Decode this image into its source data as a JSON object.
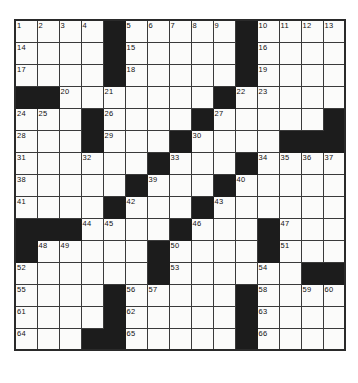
{
  "puzzle": {
    "title": "Crossword Puzzle Grid",
    "rows": 15,
    "cols": 15,
    "cell_size_px": 22,
    "colors": {
      "block": "#1c1c1c",
      "open": "#fbfbfa",
      "grid_line": "#3a3a3a",
      "border": "#2a2a2a",
      "number_text": "#111111"
    },
    "numbers_visible": [
      1,
      2,
      3,
      4,
      5,
      6,
      7,
      8,
      9,
      10,
      11,
      12,
      13,
      14,
      15,
      16,
      17,
      18,
      19,
      20,
      21,
      22,
      23,
      24,
      25,
      26,
      27,
      28,
      29,
      30,
      31,
      32,
      33,
      34,
      35,
      36,
      37,
      38,
      39,
      40,
      41,
      42,
      43,
      44,
      45,
      46,
      47,
      48,
      49,
      50,
      51,
      52,
      53,
      54,
      55,
      56,
      57,
      58,
      59,
      60,
      61,
      62,
      63,
      64,
      65,
      66
    ],
    "grid": [
      [
        {
          "block": false,
          "num": "1"
        },
        {
          "block": false,
          "num": "2"
        },
        {
          "block": false,
          "num": "3"
        },
        {
          "block": false,
          "num": "4"
        },
        {
          "block": true,
          "num": ""
        },
        {
          "block": false,
          "num": "5"
        },
        {
          "block": false,
          "num": "6"
        },
        {
          "block": false,
          "num": "7"
        },
        {
          "block": false,
          "num": "8"
        },
        {
          "block": false,
          "num": "9"
        },
        {
          "block": true,
          "num": ""
        },
        {
          "block": false,
          "num": "10"
        },
        {
          "block": false,
          "num": "11"
        },
        {
          "block": false,
          "num": "12"
        },
        {
          "block": false,
          "num": "13"
        }
      ],
      [
        {
          "block": false,
          "num": "14"
        },
        {
          "block": false,
          "num": ""
        },
        {
          "block": false,
          "num": ""
        },
        {
          "block": false,
          "num": ""
        },
        {
          "block": true,
          "num": ""
        },
        {
          "block": false,
          "num": "15"
        },
        {
          "block": false,
          "num": ""
        },
        {
          "block": false,
          "num": ""
        },
        {
          "block": false,
          "num": ""
        },
        {
          "block": false,
          "num": ""
        },
        {
          "block": true,
          "num": ""
        },
        {
          "block": false,
          "num": "16"
        },
        {
          "block": false,
          "num": ""
        },
        {
          "block": false,
          "num": ""
        },
        {
          "block": false,
          "num": ""
        }
      ],
      [
        {
          "block": false,
          "num": "17"
        },
        {
          "block": false,
          "num": ""
        },
        {
          "block": false,
          "num": ""
        },
        {
          "block": false,
          "num": ""
        },
        {
          "block": true,
          "num": ""
        },
        {
          "block": false,
          "num": "18"
        },
        {
          "block": false,
          "num": ""
        },
        {
          "block": false,
          "num": ""
        },
        {
          "block": false,
          "num": ""
        },
        {
          "block": false,
          "num": ""
        },
        {
          "block": true,
          "num": ""
        },
        {
          "block": false,
          "num": "19"
        },
        {
          "block": false,
          "num": ""
        },
        {
          "block": false,
          "num": ""
        },
        {
          "block": false,
          "num": ""
        }
      ],
      [
        {
          "block": true,
          "num": ""
        },
        {
          "block": true,
          "num": ""
        },
        {
          "block": false,
          "num": "20"
        },
        {
          "block": false,
          "num": ""
        },
        {
          "block": false,
          "num": "21"
        },
        {
          "block": false,
          "num": ""
        },
        {
          "block": false,
          "num": ""
        },
        {
          "block": false,
          "num": ""
        },
        {
          "block": false,
          "num": ""
        },
        {
          "block": true,
          "num": ""
        },
        {
          "block": false,
          "num": "22"
        },
        {
          "block": false,
          "num": "23"
        },
        {
          "block": false,
          "num": ""
        },
        {
          "block": false,
          "num": ""
        },
        {
          "block": false,
          "num": ""
        }
      ],
      [
        {
          "block": false,
          "num": "24"
        },
        {
          "block": false,
          "num": "25"
        },
        {
          "block": false,
          "num": ""
        },
        {
          "block": true,
          "num": ""
        },
        {
          "block": false,
          "num": "26"
        },
        {
          "block": false,
          "num": ""
        },
        {
          "block": false,
          "num": ""
        },
        {
          "block": false,
          "num": ""
        },
        {
          "block": true,
          "num": ""
        },
        {
          "block": false,
          "num": "27"
        },
        {
          "block": false,
          "num": ""
        },
        {
          "block": false,
          "num": ""
        },
        {
          "block": false,
          "num": ""
        },
        {
          "block": false,
          "num": ""
        },
        {
          "block": true,
          "num": ""
        }
      ],
      [
        {
          "block": false,
          "num": "28"
        },
        {
          "block": false,
          "num": ""
        },
        {
          "block": false,
          "num": ""
        },
        {
          "block": true,
          "num": ""
        },
        {
          "block": false,
          "num": "29"
        },
        {
          "block": false,
          "num": ""
        },
        {
          "block": false,
          "num": ""
        },
        {
          "block": true,
          "num": ""
        },
        {
          "block": false,
          "num": "30"
        },
        {
          "block": false,
          "num": ""
        },
        {
          "block": false,
          "num": ""
        },
        {
          "block": false,
          "num": ""
        },
        {
          "block": true,
          "num": ""
        },
        {
          "block": true,
          "num": ""
        },
        {
          "block": true,
          "num": ""
        }
      ],
      [
        {
          "block": false,
          "num": "31"
        },
        {
          "block": false,
          "num": ""
        },
        {
          "block": false,
          "num": ""
        },
        {
          "block": false,
          "num": "32"
        },
        {
          "block": false,
          "num": ""
        },
        {
          "block": false,
          "num": ""
        },
        {
          "block": true,
          "num": ""
        },
        {
          "block": false,
          "num": "33"
        },
        {
          "block": false,
          "num": ""
        },
        {
          "block": false,
          "num": ""
        },
        {
          "block": true,
          "num": ""
        },
        {
          "block": false,
          "num": "34"
        },
        {
          "block": false,
          "num": "35"
        },
        {
          "block": false,
          "num": "36"
        },
        {
          "block": false,
          "num": "37"
        }
      ],
      [
        {
          "block": false,
          "num": "38"
        },
        {
          "block": false,
          "num": ""
        },
        {
          "block": false,
          "num": ""
        },
        {
          "block": false,
          "num": ""
        },
        {
          "block": false,
          "num": ""
        },
        {
          "block": true,
          "num": ""
        },
        {
          "block": false,
          "num": "39"
        },
        {
          "block": false,
          "num": ""
        },
        {
          "block": false,
          "num": ""
        },
        {
          "block": true,
          "num": ""
        },
        {
          "block": false,
          "num": "40"
        },
        {
          "block": false,
          "num": ""
        },
        {
          "block": false,
          "num": ""
        },
        {
          "block": false,
          "num": ""
        },
        {
          "block": false,
          "num": ""
        }
      ],
      [
        {
          "block": false,
          "num": "41"
        },
        {
          "block": false,
          "num": ""
        },
        {
          "block": false,
          "num": ""
        },
        {
          "block": false,
          "num": ""
        },
        {
          "block": true,
          "num": ""
        },
        {
          "block": false,
          "num": "42"
        },
        {
          "block": false,
          "num": ""
        },
        {
          "block": false,
          "num": ""
        },
        {
          "block": true,
          "num": ""
        },
        {
          "block": false,
          "num": "43"
        },
        {
          "block": false,
          "num": ""
        },
        {
          "block": false,
          "num": ""
        },
        {
          "block": false,
          "num": ""
        },
        {
          "block": false,
          "num": ""
        },
        {
          "block": false,
          "num": ""
        }
      ],
      [
        {
          "block": true,
          "num": ""
        },
        {
          "block": true,
          "num": ""
        },
        {
          "block": true,
          "num": ""
        },
        {
          "block": false,
          "num": "44"
        },
        {
          "block": false,
          "num": "45"
        },
        {
          "block": false,
          "num": ""
        },
        {
          "block": false,
          "num": ""
        },
        {
          "block": true,
          "num": ""
        },
        {
          "block": false,
          "num": "46"
        },
        {
          "block": false,
          "num": ""
        },
        {
          "block": false,
          "num": ""
        },
        {
          "block": true,
          "num": ""
        },
        {
          "block": false,
          "num": "47"
        },
        {
          "block": false,
          "num": ""
        },
        {
          "block": false,
          "num": ""
        }
      ],
      [
        {
          "block": true,
          "num": ""
        },
        {
          "block": false,
          "num": "48"
        },
        {
          "block": false,
          "num": "49"
        },
        {
          "block": false,
          "num": ""
        },
        {
          "block": false,
          "num": ""
        },
        {
          "block": false,
          "num": ""
        },
        {
          "block": true,
          "num": ""
        },
        {
          "block": false,
          "num": "50"
        },
        {
          "block": false,
          "num": ""
        },
        {
          "block": false,
          "num": ""
        },
        {
          "block": false,
          "num": ""
        },
        {
          "block": true,
          "num": ""
        },
        {
          "block": false,
          "num": "51"
        },
        {
          "block": false,
          "num": ""
        },
        {
          "block": false,
          "num": ""
        }
      ],
      [
        {
          "block": false,
          "num": "52"
        },
        {
          "block": false,
          "num": ""
        },
        {
          "block": false,
          "num": ""
        },
        {
          "block": false,
          "num": ""
        },
        {
          "block": false,
          "num": ""
        },
        {
          "block": false,
          "num": ""
        },
        {
          "block": true,
          "num": ""
        },
        {
          "block": false,
          "num": "53"
        },
        {
          "block": false,
          "num": ""
        },
        {
          "block": false,
          "num": ""
        },
        {
          "block": false,
          "num": ""
        },
        {
          "block": false,
          "num": "54"
        },
        {
          "block": false,
          "num": ""
        },
        {
          "block": true,
          "num": ""
        },
        {
          "block": true,
          "num": ""
        }
      ],
      [
        {
          "block": false,
          "num": "55"
        },
        {
          "block": false,
          "num": ""
        },
        {
          "block": false,
          "num": ""
        },
        {
          "block": false,
          "num": ""
        },
        {
          "block": true,
          "num": ""
        },
        {
          "block": false,
          "num": "56"
        },
        {
          "block": false,
          "num": "57"
        },
        {
          "block": false,
          "num": ""
        },
        {
          "block": false,
          "num": ""
        },
        {
          "block": false,
          "num": ""
        },
        {
          "block": true,
          "num": ""
        },
        {
          "block": false,
          "num": "58"
        },
        {
          "block": false,
          "num": ""
        },
        {
          "block": false,
          "num": "59"
        },
        {
          "block": false,
          "num": "60"
        }
      ],
      [
        {
          "block": false,
          "num": "61"
        },
        {
          "block": false,
          "num": ""
        },
        {
          "block": false,
          "num": ""
        },
        {
          "block": false,
          "num": ""
        },
        {
          "block": true,
          "num": ""
        },
        {
          "block": false,
          "num": "62"
        },
        {
          "block": false,
          "num": ""
        },
        {
          "block": false,
          "num": ""
        },
        {
          "block": false,
          "num": ""
        },
        {
          "block": false,
          "num": ""
        },
        {
          "block": true,
          "num": ""
        },
        {
          "block": false,
          "num": "63"
        },
        {
          "block": false,
          "num": ""
        },
        {
          "block": false,
          "num": ""
        },
        {
          "block": false,
          "num": ""
        }
      ],
      [
        {
          "block": false,
          "num": "64"
        },
        {
          "block": false,
          "num": ""
        },
        {
          "block": false,
          "num": ""
        },
        {
          "block": true,
          "num": ""
        },
        {
          "block": true,
          "num": ""
        },
        {
          "block": false,
          "num": "65"
        },
        {
          "block": false,
          "num": ""
        },
        {
          "block": false,
          "num": ""
        },
        {
          "block": false,
          "num": ""
        },
        {
          "block": false,
          "num": ""
        },
        {
          "block": true,
          "num": ""
        },
        {
          "block": false,
          "num": "66"
        },
        {
          "block": false,
          "num": ""
        },
        {
          "block": false,
          "num": ""
        },
        {
          "block": false,
          "num": ""
        }
      ]
    ]
  }
}
